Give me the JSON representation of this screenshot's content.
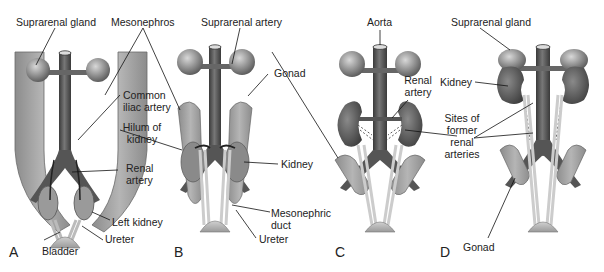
{
  "figure": {
    "panels": [
      {
        "id": "A",
        "letter": "A",
        "labels": {
          "suprarenal_gland": "Suprarenal gland",
          "mesonephros": "Mesonephros",
          "common_iliac_artery": [
            "Common",
            "iliac artery"
          ],
          "hilum_of_kidney": [
            "Hilum of",
            "kidney"
          ],
          "renal_artery": [
            "Renal",
            "artery"
          ],
          "left_kidney": "Left kidney",
          "ureter": "Ureter",
          "bladder": "Bladder"
        }
      },
      {
        "id": "B",
        "letter": "B",
        "labels": {
          "suprarenal_artery": "Suprarenal artery",
          "gonad": "Gonad",
          "kidney": "Kidney",
          "mesonephric_duct": [
            "Mesonephric",
            "duct"
          ],
          "ureter": "Ureter"
        }
      },
      {
        "id": "C",
        "letter": "C",
        "labels": {
          "aorta": "Aorta",
          "renal_artery": [
            "Renal",
            "artery"
          ]
        }
      },
      {
        "id": "D",
        "letter": "D",
        "labels": {
          "suprarenal_gland": "Suprarenal gland",
          "kidney": "Kidney",
          "sites_of_former_renal_arteries": [
            "Sites of",
            "former",
            "renal",
            "arteries"
          ],
          "gonad": "Gonad"
        }
      }
    ]
  }
}
